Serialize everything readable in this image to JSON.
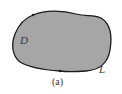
{
  "diagram": {
    "region_label": "D",
    "boundary_label": "L",
    "caption": "(a)",
    "colors": {
      "fill": "#a6a6a6",
      "stroke": "#1a1a1a",
      "background": "#ffffff"
    }
  }
}
